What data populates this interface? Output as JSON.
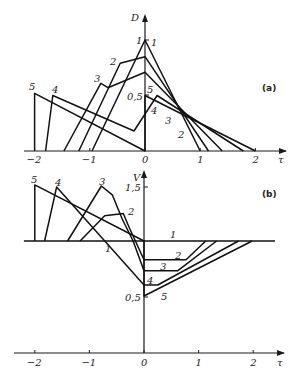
{
  "chart_data": [
    {
      "panel": "(a)",
      "type": "line",
      "xlabel": "τ",
      "ylabel": "D",
      "x_ticks": [
        "-2",
        "-1",
        "0",
        "1",
        "2"
      ],
      "y_ticks": [
        "0,5",
        "1"
      ],
      "xlim": [
        -2.2,
        2.5
      ],
      "ylim": [
        0,
        1.1
      ],
      "grid": false,
      "series": [
        {
          "name": "1",
          "points": [
            [
              -0.96,
              0
            ],
            [
              0,
              1.0
            ],
            [
              1.0,
              0
            ]
          ]
        },
        {
          "name": "2",
          "points": [
            [
              -1.2,
              0
            ],
            [
              -0.45,
              0.79
            ],
            [
              0,
              0.85
            ],
            [
              1.15,
              0
            ]
          ]
        },
        {
          "name": "3",
          "points": [
            [
              -1.47,
              0
            ],
            [
              -0.8,
              0.61
            ],
            [
              -0.67,
              0.57
            ],
            [
              0,
              0.71
            ],
            [
              1.4,
              0
            ]
          ]
        },
        {
          "name": "4",
          "points": [
            [
              -1.8,
              0
            ],
            [
              -1.67,
              0.5
            ],
            [
              -0.2,
              0.18
            ],
            [
              0.22,
              0.5
            ],
            [
              1.78,
              0
            ]
          ]
        },
        {
          "name": "5",
          "points": [
            [
              -2.0,
              0
            ],
            [
              -2.0,
              0.52
            ],
            [
              0,
              0
            ],
            [
              0,
              0.5
            ],
            [
              2.0,
              0
            ]
          ]
        }
      ]
    },
    {
      "panel": "(b)",
      "type": "line",
      "xlabel": "τ",
      "ylabel": "V",
      "x_ticks": [
        "-2",
        "-1",
        "0",
        "1",
        "2"
      ],
      "y_ticks": [
        "0,5",
        "1,5"
      ],
      "xlim": [
        -2.2,
        2.5
      ],
      "ylim": [
        -0.5,
        1.6
      ],
      "grid": false,
      "series": [
        {
          "name": "1",
          "points": [
            [
              -2.2,
              1.0
            ],
            [
              2.4,
              1.0
            ]
          ]
        },
        {
          "name": "2",
          "points": [
            [
              -1.17,
              1.0
            ],
            [
              -0.72,
              1.23
            ],
            [
              -0.38,
              1.25
            ],
            [
              -0.27,
              1.12
            ],
            [
              0,
              0.83
            ],
            [
              0.77,
              0.83
            ],
            [
              1.13,
              1.0
            ]
          ]
        },
        {
          "name": "3",
          "points": [
            [
              -1.4,
              1.0
            ],
            [
              -0.78,
              1.5
            ],
            [
              -0.58,
              1.42
            ],
            [
              -0.4,
              1.2
            ],
            [
              -0.2,
              1.0
            ],
            [
              0,
              0.73
            ],
            [
              0.62,
              0.73
            ],
            [
              1.33,
              1.0
            ]
          ]
        },
        {
          "name": "4",
          "points": [
            [
              -1.82,
              1.0
            ],
            [
              -1.6,
              1.49
            ],
            [
              0,
              0.6
            ],
            [
              0.25,
              0.6
            ],
            [
              1.73,
              1.0
            ]
          ]
        },
        {
          "name": "5",
          "points": [
            [
              -2.0,
              1.0
            ],
            [
              -2.0,
              1.51
            ],
            [
              0,
              1.0
            ],
            [
              0,
              0.5
            ],
            [
              1.98,
              1.0
            ]
          ]
        }
      ]
    }
  ],
  "labels": {
    "panel_a": "(a)",
    "panel_b": "(b)",
    "axis_a_y": "D",
    "axis_b_y": "V",
    "axis_x": "τ",
    "ticks_x": [
      "−2",
      "−1",
      "0",
      "1",
      "2"
    ],
    "tick_a_1": "1",
    "tick_a_05": "0,5",
    "tick_b_15": "1,5",
    "tick_b_05": "0,5",
    "curve_labels": [
      "1",
      "2",
      "3",
      "4",
      "5"
    ]
  }
}
